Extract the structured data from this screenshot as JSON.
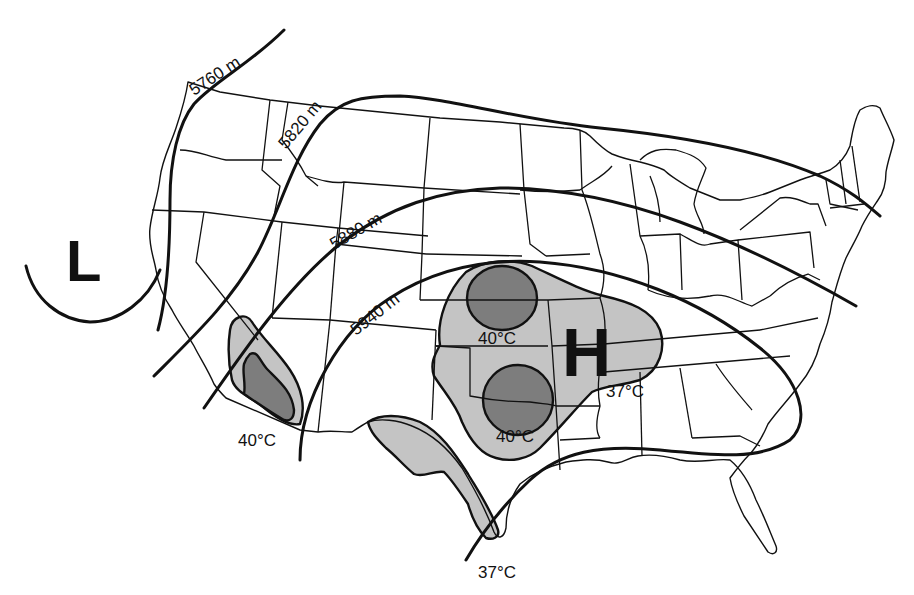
{
  "map": {
    "title": "",
    "region": "Contiguous United States",
    "colors": {
      "background": "#ffffff",
      "outline": "#111111",
      "zone_37C": "#c4c4c4",
      "zone_40C": "#7d7d7d"
    },
    "pressure_centers": [
      {
        "label": "L",
        "type": "low",
        "location": "off Pacific coast"
      },
      {
        "label": "H",
        "type": "high",
        "location": "central Plains"
      }
    ],
    "height_contours": [
      {
        "label": "5760 m",
        "value": 5760,
        "unit": "m"
      },
      {
        "label": "5820 m",
        "value": 5820,
        "unit": "m"
      },
      {
        "label": "5880 m",
        "value": 5880,
        "unit": "m"
      },
      {
        "label": "5940 m",
        "value": 5940,
        "unit": "m"
      }
    ],
    "temperature_zones": [
      {
        "label": "40°C",
        "value": 40,
        "unit": "°C",
        "area": "Desert Southwest"
      },
      {
        "label": "40°C",
        "value": 40,
        "unit": "°C",
        "area": "Kansas/Nebraska"
      },
      {
        "label": "40°C",
        "value": 40,
        "unit": "°C",
        "area": "Oklahoma/Texas"
      },
      {
        "label": "37°C",
        "value": 37,
        "unit": "°C",
        "area": "Southern Plains / Mid-Mississippi"
      },
      {
        "label": "37°C",
        "value": 37,
        "unit": "°C",
        "area": "West/South Texas"
      }
    ]
  }
}
